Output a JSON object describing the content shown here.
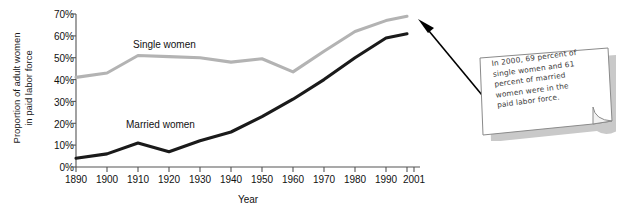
{
  "chart_data": {
    "type": "line",
    "title": "",
    "xlabel": "Year",
    "ylabel": "Proportion of adult women in paid labor force",
    "ylabel_line1": "Proportion of adult women",
    "ylabel_line2": "in paid labor force",
    "grid": false,
    "legend_position": "inline-on-series",
    "x": [
      1890,
      1900,
      1910,
      1920,
      1930,
      1940,
      1950,
      1960,
      1970,
      1980,
      1990,
      2000
    ],
    "categories": [
      "1890",
      "1900",
      "1910",
      "1920",
      "1930",
      "1940",
      "1950",
      "1960",
      "1970",
      "1980",
      "1990",
      "2001"
    ],
    "xtick_labels": [
      "1890",
      "1900",
      "1910",
      "1920",
      "1930",
      "1940",
      "1950",
      "1960",
      "1970",
      "1980",
      "1990",
      "2001"
    ],
    "ytick_labels": [
      "0%",
      "10%",
      "20%",
      "30%",
      "40%",
      "50%",
      "60%",
      "70%"
    ],
    "ytick_values": [
      0,
      10,
      20,
      30,
      40,
      50,
      60,
      70
    ],
    "ylim": [
      0,
      70
    ],
    "xlim": [
      1890,
      2001
    ],
    "series": [
      {
        "name": "Single women",
        "color": "#b3b3b3",
        "values": [
          41,
          43,
          51,
          50.5,
          50,
          48,
          49.5,
          43.5,
          53,
          62,
          67,
          69
        ]
      },
      {
        "name": "Married women",
        "color": "#1a1a1a",
        "values": [
          4,
          6,
          11,
          7,
          12,
          16,
          23,
          31,
          40,
          50,
          59,
          61
        ]
      }
    ],
    "annotations": [
      {
        "name": "callout-note",
        "text": "In 2000, 69 percent of single women and 61 percent of married women were in the paid labor force.",
        "lines": [
          "In 2000, 69 percent of",
          "single women and 61",
          "percent of married",
          "women were in the",
          "paid labor force."
        ],
        "points_to": "2000 data point"
      }
    ]
  },
  "axes": {
    "y_title_line1": "Proportion of adult women",
    "y_title_line2": "in paid labor force",
    "x_title": "Year"
  },
  "labels": {
    "single": "Single women",
    "married": "Married women"
  },
  "colors": {
    "single_women": "#b3b3b3",
    "married_women": "#1a1a1a",
    "axis": "#555555",
    "text": "#111111",
    "note_text": "#3b3b3b",
    "note_border": "#8a8a8a",
    "background": "#ffffff"
  }
}
